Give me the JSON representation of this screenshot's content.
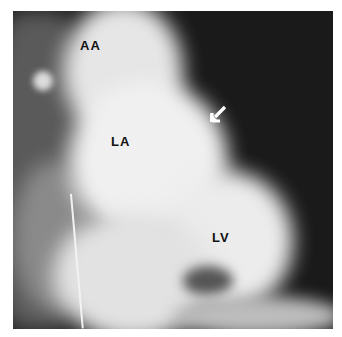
{
  "image": {
    "type": "angiogram",
    "labels": [
      {
        "id": "aa",
        "text": "AA"
      },
      {
        "id": "la",
        "text": "LA"
      },
      {
        "id": "lv",
        "text": "LV"
      }
    ],
    "annotations": [
      {
        "id": "arrow",
        "glyph": "white-arrow",
        "direction": "down-left"
      }
    ]
  }
}
